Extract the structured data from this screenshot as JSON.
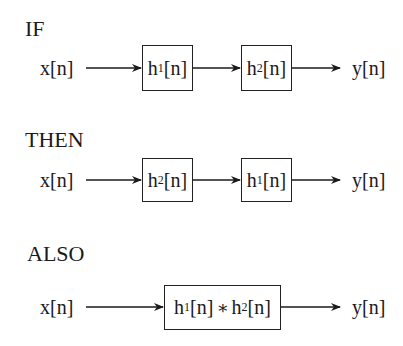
{
  "sections": [
    {
      "heading": "IF",
      "input": "x[n]",
      "output": "y[n]",
      "blocks": [
        {
          "base": "h",
          "sub": "1",
          "arg": "[n]"
        },
        {
          "base": "h",
          "sub": "2",
          "arg": "[n]"
        }
      ]
    },
    {
      "heading": "THEN",
      "input": "x[n]",
      "output": "y[n]",
      "blocks": [
        {
          "base": "h",
          "sub": "2",
          "arg": "[n]"
        },
        {
          "base": "h",
          "sub": "1",
          "arg": "[n]"
        }
      ]
    },
    {
      "heading": "ALSO",
      "input": "x[n]",
      "output": "y[n]",
      "blocks": [
        {
          "base": "h",
          "sub": "1",
          "arg": "[n]",
          "op": "∗",
          "base2": "h",
          "sub2": "2",
          "arg2": "[n]"
        }
      ]
    }
  ]
}
